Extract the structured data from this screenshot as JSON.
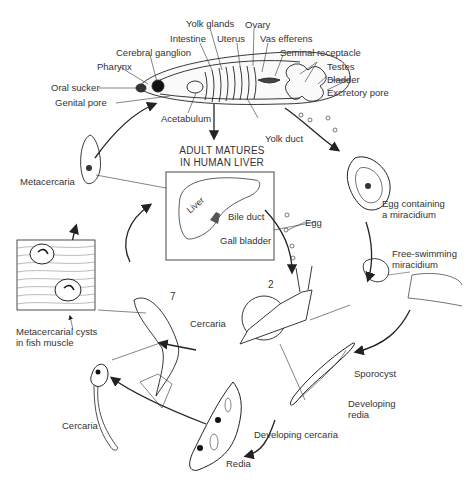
{
  "diagram": {
    "adult_anatomy_labels": [
      "Yolk glands",
      "Ovary",
      "Intestine",
      "Uterus",
      "Vas efferens",
      "Cerebral ganglion",
      "Seminal receptacle",
      "Pharynx",
      "Testes",
      "Bladder",
      "Oral sucker",
      "Excretory pore",
      "Genital pore",
      "Acetabulum",
      "Yolk duct"
    ],
    "center": {
      "title_line1": "ADULT MATURES",
      "title_line2": "IN HUMAN LIVER",
      "liver": "Liver",
      "bile_duct": "Bile duct",
      "gall_bladder": "Gall bladder"
    },
    "stages": {
      "egg_miracidium_line1": "Egg containing",
      "egg_miracidium_line2": "a miracidium",
      "free_swimming_line1": "Free-swimming",
      "free_swimming_line2": "miracidium",
      "egg": "Egg",
      "sporocyst": "Sporocyst",
      "developing_redia_line1": "Developing",
      "developing_redia_line2": "redia",
      "developing_cercaria": "Developing cercaria",
      "redia": "Redia",
      "cercaria_bottom": "Cercaria",
      "cercaria_snail": "Cercaria",
      "metacercarial_line1": "Metacercarial cysts",
      "metacercarial_line2": "in fish muscle",
      "metacercaria": "Metacercaria"
    },
    "host_numbers": {
      "snail": "2",
      "fish": "7"
    }
  }
}
